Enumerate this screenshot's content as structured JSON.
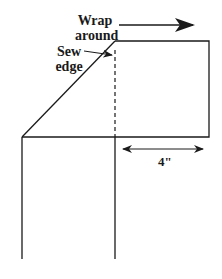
{
  "diagram": {
    "labels": {
      "wrap_line1": "Wrap",
      "wrap_line2": "around",
      "sew_line1": "Sew",
      "sew_line2": "edge",
      "measurement": "4\""
    },
    "colors": {
      "stroke": "#1a1a1a",
      "background": "#ffffff"
    }
  }
}
